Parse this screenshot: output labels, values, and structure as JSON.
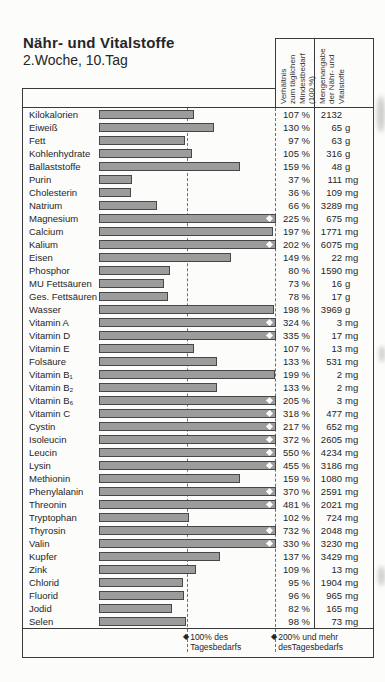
{
  "page": {
    "title": "Nähr- und Vitalstoffe",
    "subtitle": "2.Woche, 10.Tag"
  },
  "headers": {
    "ratio": "Verhältnis\nzum täglichen\nMindestbedarf\n(100 %)",
    "amount": "Mengenangabe\nder Nähr- und\nVitalstoffe"
  },
  "legend": {
    "marker": "◆",
    "daily_100": "100% des\nTagesbedarfs",
    "daily_200": "200% und mehr\ndesTagesbedarfs"
  },
  "colors": {
    "bar_fill": "#9c9c9c",
    "bar_border": "#474747",
    "grid_line": "#3a3a3a",
    "dashed_line": "#6e6e6e",
    "text": "#262626"
  },
  "chart_data": {
    "type": "bar",
    "orientation": "horizontal",
    "title": "Nähr- und Vitalstoffe",
    "subtitle": "2.Woche, 10.Tag",
    "value_axis": {
      "unit": "%",
      "min": 0,
      "display_cap": 200,
      "reference_lines_pct": [
        100,
        200
      ]
    },
    "cap_marker_meaning": "200% und mehr desTagesbedarfs",
    "rows": [
      {
        "label": "Kilokalorien",
        "pct": 107,
        "pct_label": "107 %",
        "amount": "2132",
        "unit": ""
      },
      {
        "label": "Eiweiß",
        "pct": 130,
        "pct_label": "130 %",
        "amount": "65",
        "unit": "g"
      },
      {
        "label": "Fett",
        "pct": 97,
        "pct_label": "97 %",
        "amount": "63",
        "unit": "g"
      },
      {
        "label": "Kohlenhydrate",
        "pct": 105,
        "pct_label": "105 %",
        "amount": "316",
        "unit": "g"
      },
      {
        "label": "Ballaststoffe",
        "pct": 159,
        "pct_label": "159 %",
        "amount": "48",
        "unit": "g"
      },
      {
        "label": "Purin",
        "pct": 37,
        "pct_label": "37 %",
        "amount": "111",
        "unit": "mg"
      },
      {
        "label": "Cholesterin",
        "pct": 36,
        "pct_label": "36 %",
        "amount": "109",
        "unit": "mg"
      },
      {
        "label": "Natrium",
        "pct": 66,
        "pct_label": "66 %",
        "amount": "3289",
        "unit": "mg"
      },
      {
        "label": "Magnesium",
        "pct": 225,
        "pct_label": "225 %",
        "amount": "675",
        "unit": "mg"
      },
      {
        "label": "Calcium",
        "pct": 197,
        "pct_label": "197 %",
        "amount": "1771",
        "unit": "mg"
      },
      {
        "label": "Kalium",
        "pct": 202,
        "pct_label": "202 %",
        "amount": "6075",
        "unit": "mg"
      },
      {
        "label": "Eisen",
        "pct": 149,
        "pct_label": "149 %",
        "amount": "22",
        "unit": "mg"
      },
      {
        "label": "Phosphor",
        "pct": 80,
        "pct_label": "80 %",
        "amount": "1590",
        "unit": "mg"
      },
      {
        "label": "MU Fettsäuren",
        "pct": 73,
        "pct_label": "73 %",
        "amount": "16",
        "unit": "g"
      },
      {
        "label": "Ges. Fettsäuren",
        "pct": 78,
        "pct_label": "78 %",
        "amount": "17",
        "unit": "g"
      },
      {
        "label": "Wasser",
        "pct": 198,
        "pct_label": "198 %",
        "amount": "3969",
        "unit": "g"
      },
      {
        "label": "Vitamin A",
        "pct": 324,
        "pct_label": "324 %",
        "amount": "3",
        "unit": "mg"
      },
      {
        "label": "Vitamin D",
        "pct": 335,
        "pct_label": "335 %",
        "amount": "17",
        "unit": "mg"
      },
      {
        "label": "Vitamin E",
        "pct": 107,
        "pct_label": "107 %",
        "amount": "13",
        "unit": "mg"
      },
      {
        "label": "Folsäure",
        "pct": 133,
        "pct_label": "133 %",
        "amount": "531",
        "unit": "mg"
      },
      {
        "label": "Vitamin B₁",
        "pct": 199,
        "pct_label": "199 %",
        "amount": "2",
        "unit": "mg"
      },
      {
        "label": "Vitamin B₂",
        "pct": 133,
        "pct_label": "133 %",
        "amount": "2",
        "unit": "mg"
      },
      {
        "label": "Vitamin B₆",
        "pct": 205,
        "pct_label": "205 %",
        "amount": "3",
        "unit": "mg"
      },
      {
        "label": "Vitamin C",
        "pct": 318,
        "pct_label": "318 %",
        "amount": "477",
        "unit": "mg"
      },
      {
        "label": "Cystin",
        "pct": 217,
        "pct_label": "217 %",
        "amount": "652",
        "unit": "mg"
      },
      {
        "label": "Isoleucin",
        "pct": 372,
        "pct_label": "372 %",
        "amount": "2605",
        "unit": "mg"
      },
      {
        "label": "Leucin",
        "pct": 550,
        "pct_label": "550 %",
        "amount": "4234",
        "unit": "mg"
      },
      {
        "label": "Lysin",
        "pct": 455,
        "pct_label": "455 %",
        "amount": "3186",
        "unit": "mg"
      },
      {
        "label": "Methionin",
        "pct": 159,
        "pct_label": "159 %",
        "amount": "1080",
        "unit": "mg"
      },
      {
        "label": "Phenylalanin",
        "pct": 370,
        "pct_label": "370 %",
        "amount": "2591",
        "unit": "mg"
      },
      {
        "label": "Threonin",
        "pct": 481,
        "pct_label": "481 %",
        "amount": "2021",
        "unit": "mg"
      },
      {
        "label": "Tryptophan",
        "pct": 102,
        "pct_label": "102 %",
        "amount": "724",
        "unit": "mg"
      },
      {
        "label": "Thyrosin",
        "pct": 732,
        "pct_label": "732 %",
        "amount": "2048",
        "unit": "mg"
      },
      {
        "label": "Valin",
        "pct": 330,
        "pct_label": "330 %",
        "amount": "3230",
        "unit": "mg"
      },
      {
        "label": "Kupfer",
        "pct": 137,
        "pct_label": "137 %",
        "amount": "3429",
        "unit": "mg"
      },
      {
        "label": "Zink",
        "pct": 109,
        "pct_label": "109 %",
        "amount": "13",
        "unit": "mg"
      },
      {
        "label": "Chlorid",
        "pct": 95,
        "pct_label": "95 %",
        "amount": "1904",
        "unit": "mg"
      },
      {
        "label": "Fluorid",
        "pct": 96,
        "pct_label": "96 %",
        "amount": "965",
        "unit": "mg"
      },
      {
        "label": "Jodid",
        "pct": 82,
        "pct_label": "82 %",
        "amount": "165",
        "unit": "mg"
      },
      {
        "label": "Selen",
        "pct": 98,
        "pct_label": "98 %",
        "amount": "73",
        "unit": "mg"
      }
    ]
  }
}
